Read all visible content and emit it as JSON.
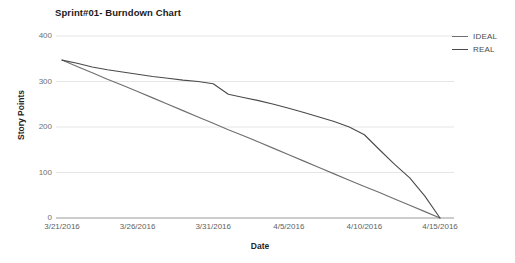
{
  "chart_data": {
    "type": "line",
    "title": "Sprint#01- Burndown Chart",
    "xlabel": "Date",
    "ylabel": "Story Points",
    "grid": true,
    "legend_position": "right",
    "ylim": [
      0,
      400
    ],
    "yticks": [
      0,
      100,
      200,
      300,
      400
    ],
    "ytick_labels": [
      "0",
      "100",
      "200",
      "300",
      "400"
    ],
    "xtick_labels": [
      "3/21/2016",
      "3/26/2016",
      "3/31/2016",
      "4/5/2016",
      "4/10/2016",
      "4/15/2016"
    ],
    "x": [
      "3/21/2016",
      "3/22/2016",
      "3/23/2016",
      "3/24/2016",
      "3/25/2016",
      "3/26/2016",
      "3/27/2016",
      "3/28/2016",
      "3/29/2016",
      "3/30/2016",
      "3/31/2016",
      "4/1/2016",
      "4/2/2016",
      "4/3/2016",
      "4/4/2016",
      "4/5/2016",
      "4/6/2016",
      "4/7/2016",
      "4/8/2016",
      "4/9/2016",
      "4/10/2016",
      "4/11/2016",
      "4/12/2016",
      "4/13/2016",
      "4/14/2016",
      "4/15/2016"
    ],
    "series": [
      {
        "name": "IDEAL",
        "color": "#6e6e6e",
        "values": [
          347,
          333,
          319,
          305,
          292,
          278,
          264,
          250,
          236,
          222,
          208,
          194,
          181,
          167,
          153,
          139,
          125,
          111,
          97,
          83,
          69,
          56,
          42,
          28,
          14,
          0
        ]
      },
      {
        "name": "REAL",
        "color": "#4a4a4a",
        "values": [
          347,
          340,
          332,
          326,
          321,
          316,
          311,
          307,
          303,
          300,
          295,
          272,
          265,
          258,
          250,
          241,
          232,
          222,
          212,
          200,
          183,
          150,
          118,
          88,
          48,
          0
        ]
      }
    ]
  },
  "legend": {
    "items": [
      {
        "label": "IDEAL"
      },
      {
        "label": "REAL"
      }
    ]
  }
}
